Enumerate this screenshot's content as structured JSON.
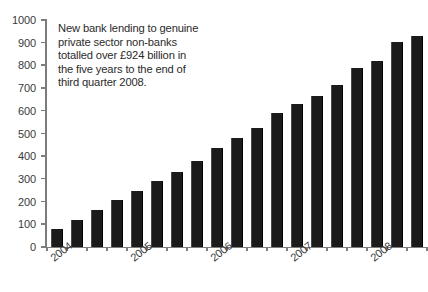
{
  "chart_data": {
    "type": "bar",
    "title": "",
    "subtitle": "",
    "xlabel": "",
    "ylabel": "",
    "ylim": [
      0,
      1000
    ],
    "ytick_step": 100,
    "grid": false,
    "legend": null,
    "bar_color": "#1b1b1b",
    "background_color": "#ffffff",
    "axis_color": "#7d7d7d",
    "categories": [
      "2004 Q1",
      "2004 Q2",
      "2004 Q3",
      "2004 Q4",
      "2005 Q1",
      "2005 Q2",
      "2005 Q3",
      "2005 Q4",
      "2006 Q1",
      "2006 Q2",
      "2006 Q3",
      "2006 Q4",
      "2007 Q1",
      "2007 Q2",
      "2007 Q3",
      "2007 Q4",
      "2008 Q1",
      "2008 Q2",
      "2008 Q3"
    ],
    "values": [
      80,
      120,
      165,
      205,
      245,
      290,
      330,
      380,
      435,
      480,
      525,
      590,
      630,
      665,
      715,
      790,
      820,
      905,
      930
    ],
    "yticks": [
      {
        "value": 1000,
        "label": "1000"
      },
      {
        "value": 900,
        "label": "900"
      },
      {
        "value": 800,
        "label": "800"
      },
      {
        "value": 700,
        "label": "700"
      },
      {
        "value": 600,
        "label": "600"
      },
      {
        "value": 500,
        "label": "500"
      },
      {
        "value": 400,
        "label": "400"
      },
      {
        "value": 300,
        "label": "300"
      },
      {
        "value": 200,
        "label": "200"
      },
      {
        "value": 100,
        "label": "100"
      },
      {
        "value": 0,
        "label": "0"
      }
    ],
    "year_labels": [
      {
        "label": "2004",
        "category_index": 0
      },
      {
        "label": "2005",
        "category_index": 4
      },
      {
        "label": "2006",
        "category_index": 8
      },
      {
        "label": "2007",
        "category_index": 12
      },
      {
        "label": "2008",
        "category_index": 16
      }
    ],
    "annotations": [
      {
        "name": "summary-note",
        "lines": [
          "New bank lending to genuine",
          "private sector non-banks",
          "totalled over £924 billion in",
          "the five years to the end of",
          "third quarter 2008."
        ]
      }
    ]
  }
}
